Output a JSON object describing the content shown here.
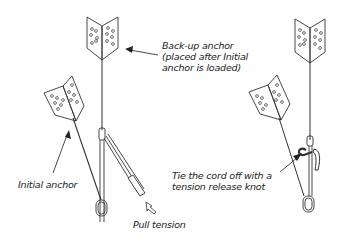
{
  "diagram": {
    "labels": {
      "backup_anchor": [
        "Back-up anchor",
        "(placed after Initial",
        "anchor is loaded)"
      ],
      "initial_anchor": "Initial anchor",
      "pull_tension": "Pull tension",
      "tie_off": [
        "Tie the cord off with a",
        "tension release knot"
      ]
    },
    "panels": [
      {
        "name": "left",
        "elements": [
          "back-up anchor plate",
          "initial anchor plate",
          "cord",
          "carabiner",
          "pulley sling",
          "pull arrow"
        ]
      },
      {
        "name": "right",
        "elements": [
          "back-up anchor plate",
          "initial anchor plate",
          "cord",
          "tension release knot",
          "carabiner"
        ]
      }
    ],
    "colors": {
      "line": "#333333",
      "background": "#ffffff"
    }
  }
}
